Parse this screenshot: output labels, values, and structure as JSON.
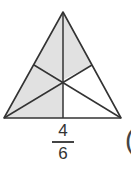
{
  "diagram": {
    "shape": "triangle divided by medians into 6 parts",
    "parts_total": 6,
    "parts_shaded": 4,
    "fill_color": "#e1e1e1",
    "stroke_color": "#333333"
  },
  "fraction": {
    "numerator": "4",
    "denominator": "6"
  },
  "paren": "("
}
